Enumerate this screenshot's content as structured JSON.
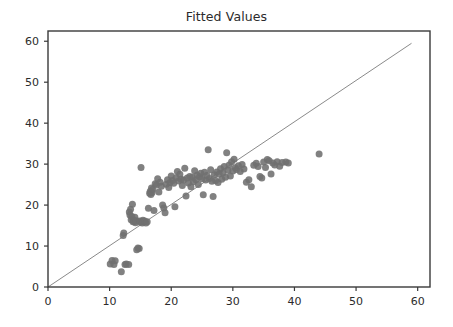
{
  "chart_data": {
    "type": "scatter",
    "title": "Fitted Values",
    "xlabel": "",
    "ylabel": "",
    "xlim": [
      0,
      62
    ],
    "ylim": [
      0,
      62.5
    ],
    "xticks": [
      0,
      10,
      20,
      30,
      40,
      50,
      60
    ],
    "yticks": [
      0,
      10,
      20,
      30,
      40,
      50,
      60
    ],
    "xticklabels": [
      "0",
      "10",
      "20",
      "30",
      "40",
      "50",
      "60"
    ],
    "yticklabels": [
      "0",
      "10",
      "20",
      "30",
      "40",
      "50",
      "60"
    ],
    "grid": false,
    "legend": null,
    "marker_color": "#707070",
    "marker_size": 7,
    "frame_color": "#3a3a3a",
    "tick_label_color": "#2b2b2b",
    "background_color": "#ffffff",
    "reference_line": {
      "name": "identity-line",
      "color": "#8a8a8a",
      "width": 1,
      "x": [
        0.0,
        59.0
      ],
      "y": [
        0.0,
        59.5
      ]
    },
    "points": [
      [
        10.1,
        5.6
      ],
      [
        10.4,
        6.5
      ],
      [
        10.7,
        5.5
      ],
      [
        10.9,
        6.4
      ],
      [
        11.9,
        3.7
      ],
      [
        12.2,
        12.6
      ],
      [
        12.3,
        13.2
      ],
      [
        12.5,
        5.5
      ],
      [
        12.7,
        5.6
      ],
      [
        13.1,
        5.5
      ],
      [
        13.2,
        18.3
      ],
      [
        13.3,
        17.6
      ],
      [
        13.4,
        19.0
      ],
      [
        13.5,
        16.4
      ],
      [
        13.6,
        17.2
      ],
      [
        13.7,
        20.2
      ],
      [
        13.8,
        15.9
      ],
      [
        13.9,
        16.3
      ],
      [
        14.0,
        16.0
      ],
      [
        14.1,
        17.0
      ],
      [
        14.2,
        15.7
      ],
      [
        14.3,
        16.2
      ],
      [
        14.4,
        9.1
      ],
      [
        14.6,
        9.5
      ],
      [
        14.8,
        9.4
      ],
      [
        14.9,
        16.1
      ],
      [
        15.0,
        15.8
      ],
      [
        15.1,
        29.2
      ],
      [
        15.2,
        16.0
      ],
      [
        15.3,
        15.6
      ],
      [
        15.4,
        16.3
      ],
      [
        15.5,
        15.9
      ],
      [
        15.7,
        16.1
      ],
      [
        15.9,
        15.6
      ],
      [
        16.1,
        15.9
      ],
      [
        16.3,
        19.2
      ],
      [
        16.5,
        22.9
      ],
      [
        16.6,
        23.4
      ],
      [
        16.7,
        22.6
      ],
      [
        16.8,
        24.2
      ],
      [
        16.9,
        23.1
      ],
      [
        17.0,
        23.8
      ],
      [
        17.2,
        18.7
      ],
      [
        17.4,
        25.2
      ],
      [
        17.6,
        24.9
      ],
      [
        17.8,
        26.4
      ],
      [
        18.0,
        23.2
      ],
      [
        18.2,
        25.6
      ],
      [
        18.4,
        24.6
      ],
      [
        18.6,
        20.0
      ],
      [
        18.8,
        19.3
      ],
      [
        19.0,
        18.1
      ],
      [
        19.2,
        25.1
      ],
      [
        19.4,
        26.2
      ],
      [
        19.6,
        24.3
      ],
      [
        19.8,
        25.5
      ],
      [
        20.0,
        27.1
      ],
      [
        20.2,
        26.0
      ],
      [
        20.4,
        25.3
      ],
      [
        20.6,
        19.6
      ],
      [
        20.8,
        26.7
      ],
      [
        21.0,
        28.2
      ],
      [
        21.2,
        25.9
      ],
      [
        21.4,
        27.5
      ],
      [
        21.6,
        26.3
      ],
      [
        21.8,
        24.8
      ],
      [
        22.0,
        26.1
      ],
      [
        22.2,
        29.0
      ],
      [
        22.4,
        22.2
      ],
      [
        22.6,
        26.6
      ],
      [
        22.8,
        25.4
      ],
      [
        23.0,
        27.0
      ],
      [
        23.2,
        24.5
      ],
      [
        23.4,
        26.8
      ],
      [
        23.6,
        25.7
      ],
      [
        23.8,
        28.4
      ],
      [
        24.0,
        26.2
      ],
      [
        24.2,
        27.3
      ],
      [
        24.4,
        25.0
      ],
      [
        24.6,
        26.9
      ],
      [
        24.8,
        27.8
      ],
      [
        25.0,
        26.4
      ],
      [
        25.2,
        22.5
      ],
      [
        25.4,
        28.0
      ],
      [
        25.6,
        26.1
      ],
      [
        25.8,
        27.2
      ],
      [
        26.0,
        33.5
      ],
      [
        26.2,
        26.5
      ],
      [
        26.4,
        28.6
      ],
      [
        26.6,
        25.8
      ],
      [
        26.8,
        22.1
      ],
      [
        27.0,
        27.4
      ],
      [
        27.2,
        26.0
      ],
      [
        27.4,
        28.1
      ],
      [
        27.6,
        25.5
      ],
      [
        27.8,
        27.6
      ],
      [
        28.0,
        28.9
      ],
      [
        28.2,
        26.3
      ],
      [
        28.4,
        27.9
      ],
      [
        28.6,
        29.4
      ],
      [
        28.8,
        26.8
      ],
      [
        29.0,
        32.8
      ],
      [
        29.2,
        28.5
      ],
      [
        29.4,
        29.8
      ],
      [
        29.6,
        27.1
      ],
      [
        29.8,
        30.6
      ],
      [
        30.0,
        28.3
      ],
      [
        30.2,
        31.2
      ],
      [
        30.4,
        29.1
      ],
      [
        30.6,
        28.7
      ],
      [
        30.9,
        29.6
      ],
      [
        31.2,
        28.2
      ],
      [
        31.5,
        29.9
      ],
      [
        31.8,
        28.8
      ],
      [
        32.2,
        25.6
      ],
      [
        32.6,
        26.2
      ],
      [
        33.0,
        24.5
      ],
      [
        33.4,
        29.7
      ],
      [
        33.8,
        30.2
      ],
      [
        34.1,
        29.4
      ],
      [
        34.4,
        27.0
      ],
      [
        34.7,
        26.6
      ],
      [
        35.0,
        30.5
      ],
      [
        35.3,
        29.2
      ],
      [
        35.6,
        31.1
      ],
      [
        35.9,
        30.8
      ],
      [
        36.2,
        27.6
      ],
      [
        36.5,
        30.3
      ],
      [
        36.8,
        29.8
      ],
      [
        37.2,
        30.6
      ],
      [
        37.6,
        29.5
      ],
      [
        38.0,
        30.4
      ],
      [
        38.6,
        30.5
      ],
      [
        39.0,
        30.3
      ],
      [
        44.0,
        32.5
      ]
    ]
  }
}
